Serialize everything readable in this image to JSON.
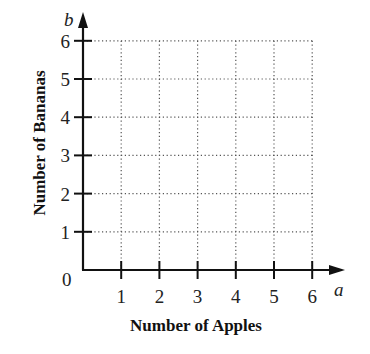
{
  "chart_data": {
    "type": "scatter",
    "title": "",
    "xlabel": "Number of Apples",
    "ylabel": "Number of Bananas",
    "x_variable": "a",
    "y_variable": "b",
    "origin_label": "0",
    "x_ticks": [
      "1",
      "2",
      "3",
      "4",
      "5",
      "6"
    ],
    "y_ticks": [
      "1",
      "2",
      "3",
      "4",
      "5",
      "6"
    ],
    "xlim": [
      0,
      6.5
    ],
    "ylim": [
      0,
      6.5
    ],
    "grid": "dotted",
    "series": [],
    "legend": null
  },
  "colors": {
    "axis": "#111111",
    "grid": "#555555",
    "background": "#ffffff"
  }
}
